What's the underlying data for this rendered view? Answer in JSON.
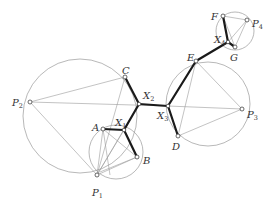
{
  "diagram": {
    "labels": {
      "A": "A",
      "B": "B",
      "C": "C",
      "D": "D",
      "E": "E",
      "F": "F",
      "G": "G",
      "P1": "P",
      "P1_sub": "1",
      "P2": "P",
      "P2_sub": "2",
      "P3": "P",
      "P3_sub": "3",
      "P4": "P",
      "P4_sub": "4",
      "X1": "X",
      "X1_sub": "1",
      "X2": "X",
      "X2_sub": "2",
      "X3": "X",
      "X3_sub": "3",
      "X4": "X",
      "X4_sub": "4"
    },
    "colors": {
      "thin_line": "#9a9a9a",
      "thick_line": "#1a1a1a",
      "label": "#333333"
    }
  }
}
